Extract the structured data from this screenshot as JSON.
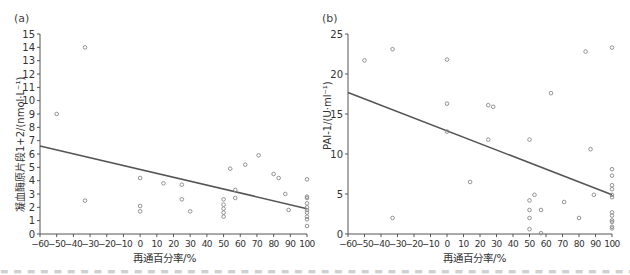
{
  "chart_data": [
    {
      "panel": "(a)",
      "type": "scatter",
      "title": "",
      "xlabel": "再通百分率/%",
      "ylabel": "凝血酶原片段1+2/(nmol·L⁻¹)",
      "xlim": [
        -60,
        100
      ],
      "ylim": [
        0,
        15
      ],
      "xticks": [
        -60,
        -50,
        -40,
        -30,
        -20,
        -10,
        0,
        10,
        20,
        30,
        40,
        50,
        60,
        70,
        80,
        90,
        100
      ],
      "yticks": [
        0,
        1,
        2,
        3,
        4,
        5,
        6,
        7,
        8,
        9,
        10,
        11,
        12,
        13,
        14,
        15
      ],
      "grid": false,
      "points": [
        [
          -50,
          9.0
        ],
        [
          -33,
          14.0
        ],
        [
          -33,
          2.5
        ],
        [
          0,
          4.2
        ],
        [
          0,
          2.1
        ],
        [
          0,
          1.7
        ],
        [
          14,
          3.8
        ],
        [
          25,
          3.7
        ],
        [
          25,
          2.6
        ],
        [
          30,
          1.7
        ],
        [
          50,
          2.6
        ],
        [
          50,
          2.2
        ],
        [
          50,
          1.9
        ],
        [
          50,
          1.6
        ],
        [
          50,
          1.3
        ],
        [
          54,
          4.9
        ],
        [
          57,
          3.3
        ],
        [
          57,
          2.7
        ],
        [
          63,
          5.2
        ],
        [
          71,
          5.9
        ],
        [
          80,
          4.5
        ],
        [
          83,
          4.2
        ],
        [
          87,
          3.0
        ],
        [
          89,
          1.8
        ],
        [
          100,
          4.1
        ],
        [
          100,
          2.8
        ],
        [
          100,
          2.7
        ],
        [
          100,
          2.3
        ],
        [
          100,
          2.0
        ],
        [
          100,
          1.8
        ],
        [
          100,
          1.6
        ],
        [
          100,
          1.3
        ],
        [
          100,
          1.1
        ],
        [
          100,
          0.6
        ]
      ],
      "trendline": {
        "x": [
          -60,
          100
        ],
        "y": [
          6.6,
          1.9
        ]
      }
    },
    {
      "panel": "(b)",
      "type": "scatter",
      "title": "",
      "xlabel": "再通百分率/%",
      "ylabel": "PAI-1/(U·ml⁻¹)",
      "xlim": [
        -60,
        100
      ],
      "ylim": [
        0,
        25
      ],
      "xticks": [
        -60,
        -50,
        -40,
        -30,
        -20,
        -10,
        0,
        10,
        20,
        30,
        40,
        50,
        60,
        70,
        80,
        90,
        100
      ],
      "yticks": [
        0,
        5,
        10,
        15,
        20,
        25
      ],
      "grid": false,
      "points": [
        [
          -50,
          21.7
        ],
        [
          -33,
          23.1
        ],
        [
          -33,
          2.0
        ],
        [
          0,
          21.8
        ],
        [
          0,
          16.3
        ],
        [
          0,
          12.8
        ],
        [
          14,
          6.5
        ],
        [
          25,
          16.1
        ],
        [
          25,
          11.8
        ],
        [
          28,
          15.9
        ],
        [
          50,
          11.8
        ],
        [
          50,
          4.2
        ],
        [
          50,
          3.0
        ],
        [
          50,
          2.0
        ],
        [
          50,
          0.6
        ],
        [
          53,
          4.9
        ],
        [
          57,
          3.0
        ],
        [
          57,
          0.1
        ],
        [
          63,
          17.6
        ],
        [
          71,
          4.0
        ],
        [
          80,
          2.0
        ],
        [
          84,
          22.8
        ],
        [
          87,
          10.6
        ],
        [
          89,
          4.9
        ],
        [
          100,
          23.3
        ],
        [
          100,
          8.1
        ],
        [
          100,
          7.3
        ],
        [
          100,
          6.1
        ],
        [
          100,
          5.6
        ],
        [
          100,
          4.9
        ],
        [
          100,
          4.6
        ],
        [
          100,
          2.7
        ],
        [
          100,
          2.3
        ],
        [
          100,
          1.7
        ],
        [
          100,
          1.5
        ],
        [
          100,
          0.9
        ],
        [
          100,
          0.7
        ]
      ],
      "trendline": {
        "x": [
          -60,
          100
        ],
        "y": [
          17.7,
          4.9
        ]
      }
    }
  ],
  "panels": {
    "a": {
      "label": "(a)",
      "ylabel": "凝血酶原片段1+2/(nmol·L⁻¹)",
      "xlabel": "再通百分率/%"
    },
    "b": {
      "label": "(b)",
      "ylabel": "PAI-1/(U·ml⁻¹)",
      "xlabel": "再通百分率/%"
    }
  },
  "style": {
    "axis_color": "#555555",
    "point_color": "#888888",
    "line_color": "#555555"
  }
}
